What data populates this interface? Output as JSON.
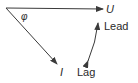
{
  "diagram": {
    "type": "phasor",
    "labels": {
      "voltage": "U",
      "current": "I",
      "angle": "φ",
      "lead": "Lead",
      "lag": "Lag"
    },
    "colors": {
      "line": "#3a3a3a",
      "text": "#2a2a2a"
    }
  }
}
